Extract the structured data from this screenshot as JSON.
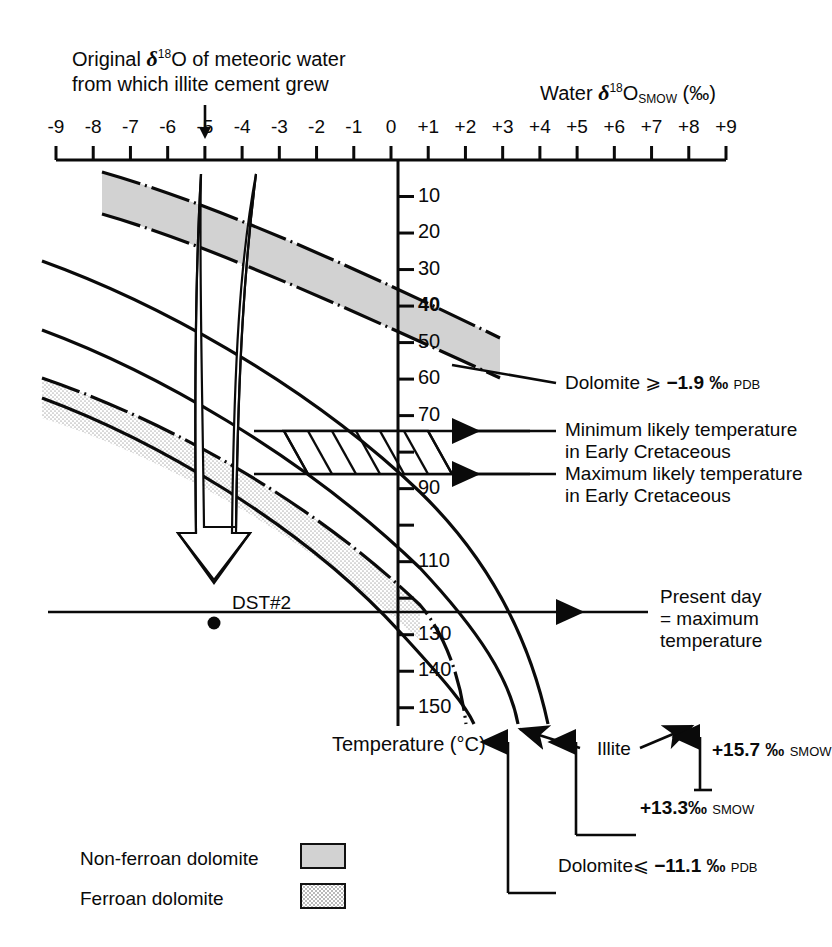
{
  "figure": {
    "annotation_top": {
      "line1_pre": "Original ",
      "delta": "δ",
      "sup": "18",
      "line1_post": "O of meteoric water",
      "line2": "from which illite cement grew",
      "pointer_value": -5
    },
    "x_axis": {
      "label_pre": "Water ",
      "delta": "δ",
      "sup": "18",
      "label_mid": "O",
      "label_sub": "SMOW",
      "label_units": "(‰)",
      "ticks": [
        "-9",
        "-8",
        "-7",
        "-6",
        "-5",
        "-4",
        "-3",
        "-2",
        "-1",
        "0",
        "+1",
        "+2",
        "+3",
        "+4",
        "+5",
        "+6",
        "+7",
        "+8",
        "+9"
      ],
      "min": -9,
      "max": 9
    },
    "y_axis": {
      "label_pre": "Temperature (",
      "label_deg": "°",
      "label_post": "C)",
      "ticks": [
        10,
        20,
        30,
        40,
        50,
        60,
        70,
        80,
        90,
        100,
        110,
        120,
        130,
        140,
        150
      ],
      "tick_labels": [
        "10",
        "20",
        "30",
        "40",
        "50",
        "60",
        "70",
        "",
        "90",
        "",
        "110",
        "",
        "130",
        "140",
        "150"
      ],
      "bold_tick": "40",
      "min": 0,
      "max": 155
    },
    "callouts": {
      "dolomite_upper": {
        "text_pre": "Dolomite ",
        "op": "⩾",
        "value": "−1.9",
        "permil": "‰",
        "scale": "PDB"
      },
      "min_temp": {
        "line1": "Minimum likely temperature",
        "line2": "in Early Cretaceous",
        "temperature": 70
      },
      "max_temp": {
        "line1": "Maximum likely temperature",
        "line2": "in Early Cretaceous",
        "temperature": 80
      },
      "present_day": {
        "line1": "Present day",
        "line2": "= maximum",
        "line3": "temperature",
        "temperature": 115
      },
      "illite": {
        "label": "Illite"
      },
      "illite_157": {
        "value": "+15.7",
        "permil": "‰",
        "scale": "SMOW"
      },
      "illite_133": {
        "value": "+13.3",
        "permil": "‰",
        "scale": "SMOW"
      },
      "dolomite_lower": {
        "text_pre": "Dolomite",
        "op": "⩽",
        "value": "−11.1",
        "permil": "‰",
        "scale": "PDB"
      },
      "dst": {
        "label": "DST#2"
      }
    },
    "legend": {
      "items": [
        {
          "label": "Non-ferroan dolomite",
          "swatch": "solid-gray",
          "color": "#d2d2d2"
        },
        {
          "label": "Ferroan dolomite",
          "swatch": "stipple-gray",
          "color": "#e7e7e7"
        }
      ]
    },
    "colors": {
      "ink": "#0a0a0a",
      "non_ferroan": "#d2d2d2",
      "ferroan": "#e8e8e8",
      "background": "#ffffff"
    }
  },
  "chart_data": {
    "type": "line",
    "xlabel": "Water δ18O SMOW (‰)",
    "ylabel": "Temperature (°C)",
    "xlim": [
      -9,
      9
    ],
    "ylim": [
      0,
      155
    ],
    "grid": false,
    "legend_position": "bottom-left",
    "series": [
      {
        "name": "Dolomite ⩾ -1.9 ‰ PDB (upper band boundary)",
        "style": "dash-dot",
        "points": [
          [
            -6.4,
            5
          ],
          [
            -4.0,
            15
          ],
          [
            -2.0,
            24
          ],
          [
            0.0,
            33
          ],
          [
            2.0,
            43
          ],
          [
            3.6,
            52
          ],
          [
            4.6,
            60
          ]
        ]
      },
      {
        "name": "Non-ferroan dolomite band lower boundary",
        "style": "dash-dot",
        "points": [
          [
            -6.4,
            22
          ],
          [
            -4.0,
            32
          ],
          [
            -2.0,
            41
          ],
          [
            0.0,
            50
          ],
          [
            2.0,
            60
          ],
          [
            3.6,
            69
          ],
          [
            4.6,
            77
          ]
        ]
      },
      {
        "name": "Minimum likely temperature curve (70 °C isotherm path)",
        "style": "solid",
        "points": [
          [
            -9.0,
            25
          ],
          [
            -6.0,
            38
          ],
          [
            -3.0,
            52
          ],
          [
            0.0,
            66
          ],
          [
            3.0,
            85
          ],
          [
            5.0,
            102
          ],
          [
            6.2,
            118
          ],
          [
            6.9,
            138
          ],
          [
            7.2,
            150
          ]
        ]
      },
      {
        "name": "Illite +13.3 ‰ SMOW",
        "style": "solid",
        "points": [
          [
            -9.0,
            44
          ],
          [
            -6.0,
            56
          ],
          [
            -3.0,
            70
          ],
          [
            0.0,
            85
          ],
          [
            3.0,
            103
          ],
          [
            5.0,
            121
          ],
          [
            6.0,
            138
          ],
          [
            6.4,
            150
          ]
        ]
      },
      {
        "name": "Illite +15.7 ‰ SMOW",
        "style": "solid",
        "points": [
          [
            -9.0,
            63
          ],
          [
            -6.0,
            76
          ],
          [
            -3.0,
            90
          ],
          [
            0.0,
            106
          ],
          [
            2.0,
            120
          ],
          [
            3.6,
            135
          ],
          [
            4.4,
            150
          ]
        ]
      },
      {
        "name": "Dolomite ⩽ -11.1 ‰ PDB (ferroan band lower boundary)",
        "style": "dash-dot",
        "points": [
          [
            -9.0,
            60
          ],
          [
            -6.0,
            73
          ],
          [
            -3.0,
            88
          ],
          [
            0.0,
            104
          ],
          [
            1.6,
            118
          ],
          [
            2.8,
            133
          ],
          [
            3.4,
            150
          ]
        ]
      }
    ],
    "bands": [
      {
        "name": "Non-ferroan dolomite",
        "between": [
          "Dolomite ⩾ -1.9 ‰ PDB (upper band boundary)",
          "Non-ferroan dolomite band lower boundary"
        ],
        "fill": "#d2d2d2"
      },
      {
        "name": "Ferroan dolomite",
        "between": [
          "Illite +15.7 ‰ SMOW",
          "Dolomite ⩽ -11.1 ‰ PDB (ferroan band lower boundary)"
        ],
        "fill": "#e8e8e8"
      }
    ],
    "annotations": [
      {
        "text": "DST#2",
        "x": -4.4,
        "y": 117,
        "marker": "dot"
      },
      {
        "text": "Present day = maximum temperature",
        "y": 115,
        "type": "horizontal-line"
      },
      {
        "text": "Minimum likely temperature in Early Cretaceous",
        "y": 70,
        "type": "horizontal-line"
      },
      {
        "text": "Maximum likely temperature in Early Cretaceous",
        "y": 80,
        "type": "horizontal-line"
      },
      {
        "text": "Hatched box: likely Early Cretaceous illite growth window",
        "x_range": [
          -3.2,
          0.5
        ],
        "y_range": [
          70,
          80
        ]
      },
      {
        "text": "Original δ18O of meteoric water from which illite cement grew",
        "x": -5,
        "type": "arrow-down"
      }
    ]
  }
}
